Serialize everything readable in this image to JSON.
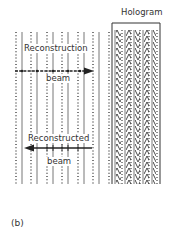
{
  "figure": {
    "panel_label": "(b)",
    "hologram": {
      "title": "Hologram"
    },
    "reconstruction_beam": {
      "label_line1": "Reconstruction",
      "label_line2": "beam",
      "direction": "right"
    },
    "reconstructed_beam": {
      "label_line1": "Reconstructed",
      "label_line2": "beam",
      "direction": "left"
    },
    "wavefronts": {
      "dotted_x": [
        16,
        31,
        47,
        62,
        78,
        93,
        109
      ],
      "solid_x": [
        22,
        37,
        53,
        68,
        84,
        99
      ],
      "top_y": 32,
      "bottom_y": 184
    },
    "colors": {
      "line": "#555555",
      "dots": "#444444",
      "text": "#333333",
      "arrow": "#222222"
    }
  }
}
